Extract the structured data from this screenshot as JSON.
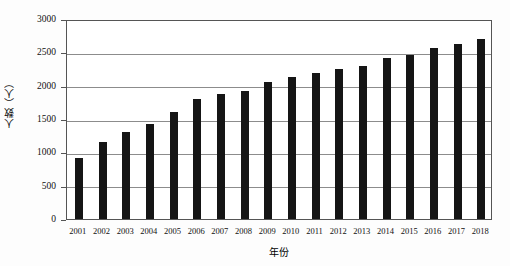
{
  "chart_data": {
    "type": "bar",
    "title": "",
    "xlabel": "年份",
    "ylabel": "人数（人）",
    "ylim": [
      0,
      3000
    ],
    "ytick_values": [
      0,
      500,
      1000,
      1500,
      2000,
      2500,
      3000
    ],
    "ytick_labels": [
      "0",
      "500",
      "1000",
      "1500",
      "2000",
      "2500",
      "3000"
    ],
    "grid": true,
    "legend": "none",
    "bar_color": "#151515",
    "categories": [
      "2001",
      "2002",
      "2003",
      "2004",
      "2005",
      "2006",
      "2007",
      "2008",
      "2009",
      "2010",
      "2011",
      "2012",
      "2013",
      "2014",
      "2015",
      "2016",
      "2017",
      "2018"
    ],
    "values": [
      920,
      1150,
      1300,
      1420,
      1600,
      1800,
      1880,
      1920,
      2050,
      2130,
      2190,
      2250,
      2300,
      2420,
      2460,
      2560,
      2620,
      2700
    ],
    "series": [
      {
        "name": "人数（人）",
        "values": [
          920,
          1150,
          1300,
          1420,
          1600,
          1800,
          1880,
          1920,
          2050,
          2130,
          2190,
          2250,
          2300,
          2420,
          2460,
          2560,
          2620,
          2700
        ]
      }
    ]
  }
}
